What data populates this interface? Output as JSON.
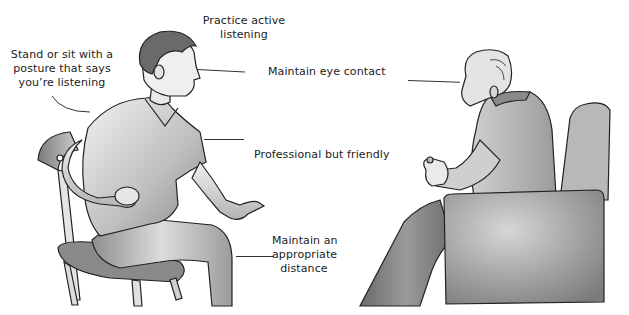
{
  "figure": {
    "labels": {
      "active_listening": [
        "Practice active",
        "listening"
      ],
      "posture": [
        "Stand or sit with a",
        "posture that says",
        "you’re listening"
      ],
      "eye_contact": "Maintain eye contact",
      "professional": "Professional but friendly",
      "distance": [
        "Maintain an",
        "appropriate",
        "distance"
      ]
    },
    "figures": {
      "left": "young man seated on wooden chair, leaning forward, gesturing",
      "right": "elderly bald man seated in armchair, holding small object"
    },
    "colors": {
      "ink": "#222222",
      "skin_light": "#e8e8e8",
      "shade_mid": "#9a9a9a",
      "shade_dark": "#5a5a5a",
      "background": "#ffffff"
    }
  }
}
